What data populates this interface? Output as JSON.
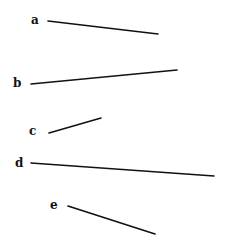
{
  "diagram": {
    "segments": [
      {
        "label": "a",
        "label_pos": [
          31,
          24
        ],
        "x1": 48,
        "y1": 21,
        "x2": 158,
        "y2": 34
      },
      {
        "label": "b",
        "label_pos": [
          13,
          87
        ],
        "x1": 31,
        "y1": 84,
        "x2": 177,
        "y2": 70
      },
      {
        "label": "c",
        "label_pos": [
          29,
          135
        ],
        "x1": 49,
        "y1": 133,
        "x2": 101,
        "y2": 118
      },
      {
        "label": "d",
        "label_pos": [
          15,
          167
        ],
        "x1": 31,
        "y1": 163,
        "x2": 214,
        "y2": 176
      },
      {
        "label": "e",
        "label_pos": [
          50,
          209
        ],
        "x1": 68,
        "y1": 206,
        "x2": 155,
        "y2": 234
      }
    ]
  }
}
